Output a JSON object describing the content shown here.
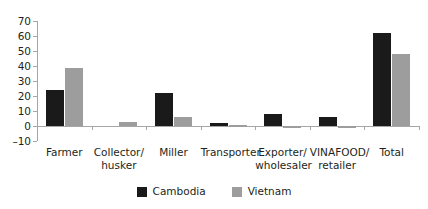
{
  "chart_data": {
    "type": "bar",
    "title": "",
    "subtitle": "",
    "xlabel": "",
    "ylabel": "",
    "ylim": [
      -10,
      70
    ],
    "y_ticks": [
      -10,
      0,
      10,
      20,
      30,
      40,
      50,
      60,
      70
    ],
    "y_tick_labels": [
      "–10",
      "0",
      "10",
      "20",
      "30",
      "40",
      "50",
      "60",
      "70"
    ],
    "grid": false,
    "legend_position": "bottom-center",
    "categories": [
      "Farmer",
      "Collector/ husker",
      "Miller",
      "Transporter",
      "Exporter/ wholesaler",
      "VINAFOOD/ retailer",
      "Total"
    ],
    "category_lines": [
      [
        "Farmer"
      ],
      [
        "Collector/",
        "husker"
      ],
      [
        "Miller"
      ],
      [
        "Transporter"
      ],
      [
        "Exporter/",
        "wholesaler"
      ],
      [
        "VINAFOOD/",
        "retailer"
      ],
      [
        "Total"
      ]
    ],
    "series": [
      {
        "name": "Cambodia",
        "color": "#1a1a1a",
        "values": [
          24,
          0,
          22,
          2,
          8,
          6,
          62
        ]
      },
      {
        "name": "Vietnam",
        "color": "#9d9d9d",
        "values": [
          39,
          3,
          6,
          0.5,
          -1,
          -1,
          48
        ]
      }
    ]
  },
  "legend": {
    "items": [
      {
        "label": "Cambodia",
        "swatch": "cambodia"
      },
      {
        "label": "Vietnam",
        "swatch": "vietnam"
      }
    ]
  },
  "colors": {
    "cambodia": "#1a1a1a",
    "vietnam": "#9d9d9d",
    "axis": "#a6a6a6",
    "text": "#231f20",
    "background": "#ffffff"
  }
}
